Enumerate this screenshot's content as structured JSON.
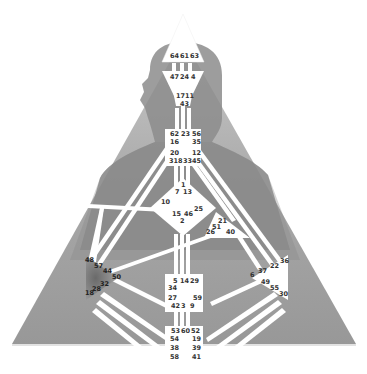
{
  "chart_title": "Human Design Bodygraph",
  "colors": {
    "background": "#ffffff",
    "triangle": "#9a9a9a",
    "triangle_light": "#b4b4b4",
    "silhouette": "#7d7d7d",
    "center_fill": "#ffffff",
    "channel": "#ffffff",
    "center_defined_dark": "#8a8a8a",
    "text": "#333333"
  },
  "centers": {
    "head": {
      "name": "Head",
      "gates": [
        "64",
        "61",
        "63"
      ]
    },
    "ajna": {
      "name": "Ajna",
      "gates": [
        "47",
        "24",
        "4",
        "17",
        "11",
        "43"
      ]
    },
    "throat": {
      "name": "Throat",
      "gates": [
        "62",
        "23",
        "56",
        "16",
        "35",
        "20",
        "12",
        "31",
        "8",
        "33",
        "45"
      ]
    },
    "g_center": {
      "name": "G Center",
      "gates": [
        "1",
        "7",
        "13",
        "10",
        "25",
        "15",
        "46",
        "2"
      ]
    },
    "heart": {
      "name": "Heart/Ego",
      "gates": [
        "21",
        "51",
        "26",
        "40"
      ]
    },
    "spleen": {
      "name": "Spleen",
      "gates": [
        "48",
        "57",
        "44",
        "50",
        "32",
        "28",
        "18"
      ]
    },
    "sacral": {
      "name": "Sacral",
      "gates": [
        "5",
        "14",
        "29",
        "34",
        "27",
        "59",
        "42",
        "3",
        "9"
      ]
    },
    "solar_plexus": {
      "name": "Solar Plexus",
      "gates": [
        "36",
        "22",
        "37",
        "6",
        "49",
        "55",
        "30"
      ]
    },
    "root": {
      "name": "Root",
      "gates": [
        "53",
        "60",
        "52",
        "54",
        "19",
        "38",
        "39",
        "58",
        "41"
      ]
    }
  },
  "labels": {
    "head_top": [
      "64",
      "61",
      "63"
    ],
    "ajna_top": [
      "47",
      "24",
      "4"
    ],
    "ajna_bottom_1": [
      "17",
      "11"
    ],
    "ajna_bottom_2": "43",
    "throat_row1": [
      "62",
      "23",
      "56"
    ],
    "throat_row2_left": "16",
    "throat_row2_right": "35",
    "throat_row3_left": "20",
    "throat_row3_right": "12",
    "throat_row4": [
      "31",
      "8",
      "33",
      "45"
    ],
    "g_1": "1",
    "g_7": "7",
    "g_13": "13",
    "g_10": "10",
    "g_25": "25",
    "g_15": "15",
    "g_46": "46",
    "g_2": "2",
    "heart_21": "21",
    "heart_51": "51",
    "heart_26": "26",
    "heart_40": "40",
    "spleen_48": "48",
    "spleen_57": "57",
    "spleen_44": "44",
    "spleen_50": "50",
    "spleen_32": "32",
    "spleen_28": "28",
    "spleen_18": "18",
    "sacral_top": [
      "5",
      "14",
      "29"
    ],
    "sacral_34": "34",
    "sacral_27": "27",
    "sacral_59": "59",
    "sacral_bottom": [
      "42",
      "3",
      "9"
    ],
    "sp_36": "36",
    "sp_22": "22",
    "sp_37": "37",
    "sp_6": "6",
    "sp_49": "49",
    "sp_55": "55",
    "sp_30": "30",
    "root_top": [
      "53",
      "60",
      "52"
    ],
    "root_54": "54",
    "root_19": "19",
    "root_38": "38",
    "root_39": "39",
    "root_58": "58",
    "root_41": "41"
  }
}
